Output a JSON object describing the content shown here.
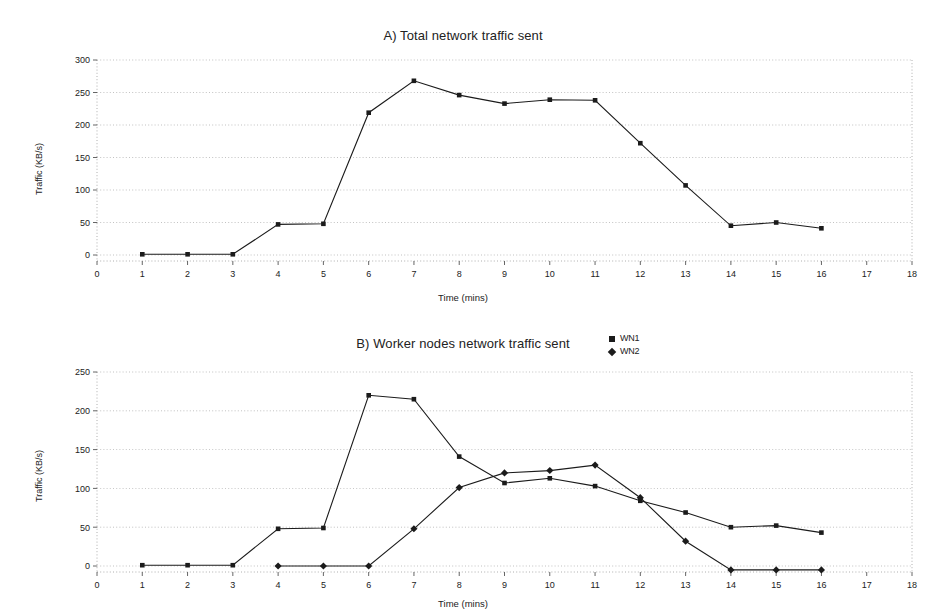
{
  "page": {
    "background": "#ffffff",
    "ink": "#1b1b1b",
    "grid_color": "#9a9a9a"
  },
  "charts": [
    {
      "id": "chart-a",
      "title": "A) Total network traffic sent",
      "xlabel": "Time (mins)",
      "ylabel": "Traffic (KB/s)",
      "legend": [],
      "x_ticks": [
        0,
        1,
        2,
        3,
        4,
        5,
        6,
        7,
        8,
        9,
        10,
        11,
        12,
        13,
        14,
        15,
        16,
        17,
        18
      ],
      "y_ticks": [
        0,
        50,
        100,
        150,
        200,
        250,
        300
      ]
    },
    {
      "id": "chart-b",
      "title": "B) Worker nodes network traffic sent",
      "xlabel": "Time (mins)",
      "ylabel": "Traffic (KB/s)",
      "legend": [
        {
          "label": "WN1",
          "marker": "square"
        },
        {
          "label": "WN2",
          "marker": "diamond"
        }
      ],
      "x_ticks": [
        0,
        1,
        2,
        3,
        4,
        5,
        6,
        7,
        8,
        9,
        10,
        11,
        12,
        13,
        14,
        15,
        16,
        17,
        18
      ],
      "y_ticks": [
        0,
        50,
        100,
        150,
        200,
        250
      ]
    }
  ],
  "chart_data": [
    {
      "type": "line",
      "id": "chart-a",
      "title": "A) Total network traffic sent",
      "xlabel": "Time (mins)",
      "ylabel": "Traffic (KB/s)",
      "xlim": [
        0,
        18
      ],
      "ylim": [
        0,
        300
      ],
      "xticks": [
        0,
        1,
        2,
        3,
        4,
        5,
        6,
        7,
        8,
        9,
        10,
        11,
        12,
        13,
        14,
        15,
        16,
        17,
        18
      ],
      "yticks": [
        0,
        50,
        100,
        150,
        200,
        250,
        300
      ],
      "grid": "horizontal",
      "legend_position": "none",
      "marker": "square",
      "x": [
        1,
        2,
        3,
        4,
        5,
        6,
        7,
        8,
        9,
        10,
        11,
        12,
        13,
        14,
        15,
        16
      ],
      "series": [
        {
          "name": "Total",
          "marker": "square",
          "values": [
            1,
            1,
            1,
            47,
            48,
            219,
            268,
            246,
            233,
            239,
            238,
            172,
            107,
            45,
            50,
            41
          ]
        }
      ]
    },
    {
      "type": "line",
      "id": "chart-b",
      "title": "B) Worker nodes network traffic sent",
      "xlabel": "Time (mins)",
      "ylabel": "Traffic (KB/s)",
      "xlim": [
        0,
        18
      ],
      "ylim": [
        0,
        250
      ],
      "xticks": [
        0,
        1,
        2,
        3,
        4,
        5,
        6,
        7,
        8,
        9,
        10,
        11,
        12,
        13,
        14,
        15,
        16,
        17,
        18
      ],
      "yticks": [
        0,
        50,
        100,
        150,
        200,
        250
      ],
      "grid": "horizontal",
      "legend_position": "top-right",
      "x": [
        1,
        2,
        3,
        4,
        5,
        6,
        7,
        8,
        9,
        10,
        11,
        12,
        13,
        14,
        15,
        16
      ],
      "series": [
        {
          "name": "WN1",
          "marker": "square",
          "values": [
            1,
            1,
            1,
            48,
            49,
            220,
            215,
            141,
            107,
            113,
            103,
            84,
            69,
            50,
            52,
            43
          ]
        },
        {
          "name": "WN2",
          "marker": "diamond",
          "values": [
            null,
            null,
            null,
            0,
            0,
            0,
            48,
            101,
            120,
            123,
            130,
            88,
            32,
            -5,
            -5,
            -5
          ]
        }
      ]
    }
  ]
}
